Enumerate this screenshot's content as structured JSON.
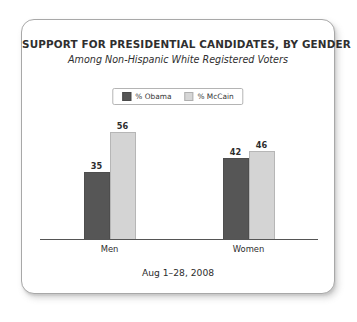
{
  "card": {
    "title": "SUPPORT FOR PRESIDENTIAL CANDIDATES, BY GENDER",
    "subtitle": "Among Non-Hispanic White Registered Voters",
    "footnote": "Aug 1–28, 2008"
  },
  "legend": {
    "items": [
      {
        "label": "% Obama",
        "color": "#565656"
      },
      {
        "label": "% McCain",
        "color": "#d4d4d4"
      }
    ]
  },
  "chart_data": {
    "type": "bar",
    "title": "SUPPORT FOR PRESIDENTIAL CANDIDATES, BY GENDER",
    "subtitle": "Among Non-Hispanic White Registered Voters",
    "annotation": "Aug 1–28, 2008",
    "categories": [
      "Men",
      "Women"
    ],
    "series": [
      {
        "name": "% Obama",
        "color": "#565656",
        "values": [
          35,
          42
        ]
      },
      {
        "name": "% McCain",
        "color": "#d4d4d4",
        "values": [
          56,
          46
        ]
      }
    ],
    "xlabel": "",
    "ylabel": "",
    "ylim": [
      0,
      62
    ],
    "grid": false,
    "legend_position": "top-center",
    "data_labels": true,
    "axis": {
      "baseline_only": true,
      "y_ticks_visible": false
    }
  }
}
